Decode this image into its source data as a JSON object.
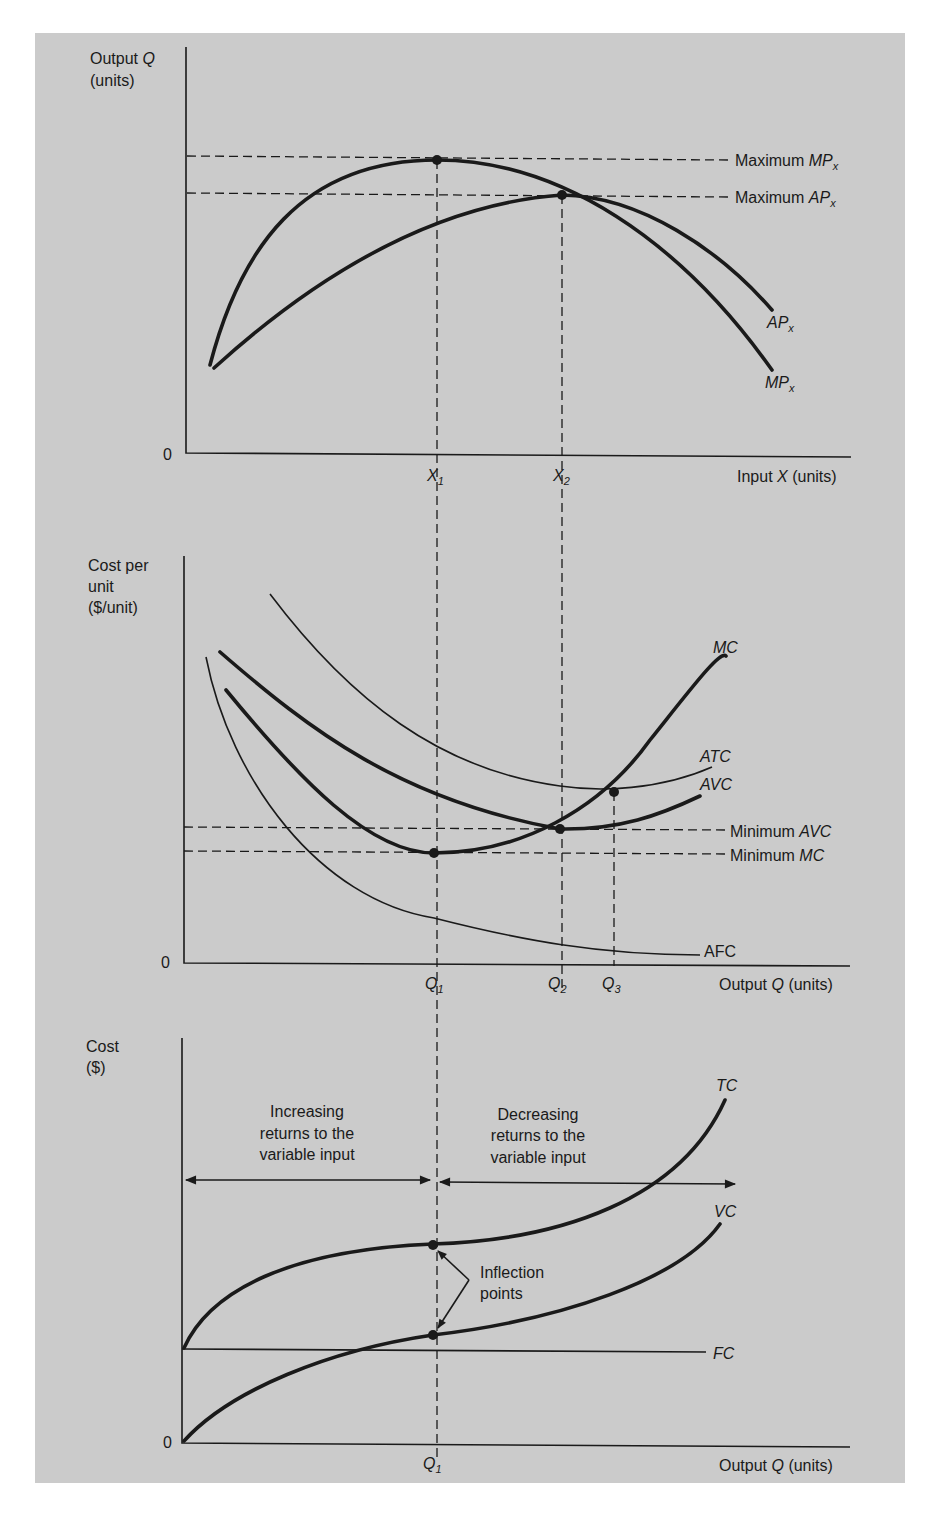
{
  "panels": {
    "production": {
      "y_axis_label_line1": "Output Q",
      "y_axis_label_line2": "(units)",
      "x_axis_label": "Input X (units)",
      "origin": "0",
      "x_ticks": [
        "X1",
        "X2"
      ],
      "curves": [
        "MPx",
        "APx"
      ],
      "annotations": [
        "Maximum MPx",
        "Maximum APx"
      ]
    },
    "unit_costs": {
      "y_axis_label_line1": "Cost per",
      "y_axis_label_line2": "unit",
      "y_axis_label_line3": "($/unit)",
      "x_axis_label": "Output Q (units)",
      "origin": "0",
      "x_ticks": [
        "Q1",
        "Q2",
        "Q3"
      ],
      "curves": [
        "MC",
        "ATC",
        "AVC",
        "AFC"
      ],
      "annotations": [
        "Minimum AVC",
        "Minimum MC"
      ]
    },
    "total_costs": {
      "y_axis_label_line1": "Cost",
      "y_axis_label_line2": "($)",
      "x_axis_label": "Output Q (units)",
      "origin": "0",
      "x_ticks": [
        "Q1"
      ],
      "curves": [
        "TC",
        "VC",
        "FC"
      ],
      "region_left": [
        "Increasing",
        "returns to the",
        "variable input"
      ],
      "region_right": [
        "Decreasing",
        "returns to the",
        "variable input"
      ],
      "inflection_label": [
        "Inflection",
        "points"
      ]
    }
  },
  "text": {
    "p1_ylab1": "Output ",
    "p1_ylab1_it": "Q",
    "p1_ylab2": "(units)",
    "p1_xlab_a": "Input ",
    "p1_xlab_it": "X",
    "p1_xlab_b": " (units)",
    "zero": "0",
    "X": "X",
    "one": "1",
    "two": "2",
    "three": "3",
    "Q": "Q",
    "max_prefix": "Maximum ",
    "MP": "MP",
    "AP": "AP",
    "x": "x",
    "p2_ylab1": "Cost per",
    "p2_ylab2": "unit",
    "p2_ylab3": "($/unit)",
    "out_a": "Output ",
    "out_b": " (units)",
    "MC": "MC",
    "ATC": "ATC",
    "AVC": "AVC",
    "AFC": "AFC",
    "min_prefix": "Minimum ",
    "p3_ylab1": "Cost",
    "p3_ylab2": "($)",
    "inc1": "Increasing",
    "inc2": "returns to the",
    "inc3": "variable input",
    "dec1": "Decreasing",
    "dec2": "returns to the",
    "dec3": "variable input",
    "infl1": "Inflection",
    "infl2": "points",
    "TC": "TC",
    "VC": "VC",
    "FC": "FC"
  },
  "colors": {
    "panel_bg": "#cbcbcb",
    "ink": "#1a1a1a",
    "page_bg": "#ffffff"
  }
}
